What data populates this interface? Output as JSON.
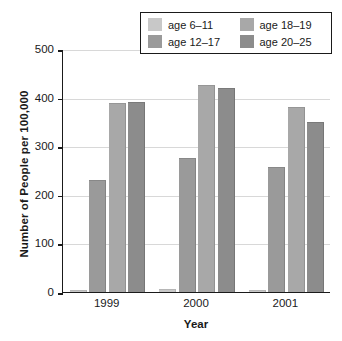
{
  "chart_data": {
    "type": "bar",
    "title": "",
    "xlabel": "Year",
    "ylabel": "Number of People per 100,000",
    "categories": [
      "1999",
      "2000",
      "2001"
    ],
    "ylim": [
      0,
      500
    ],
    "yticks": [
      0,
      100,
      200,
      300,
      400,
      500
    ],
    "ytick_labels": [
      "0",
      "100",
      "200",
      "300",
      "400",
      "500"
    ],
    "grid": true,
    "legend_position": "top-right",
    "series": [
      {
        "name": "age 6–11",
        "color": "#c8c8c8",
        "values": [
          5,
          6,
          5
        ]
      },
      {
        "name": "age 12–17",
        "color": "#9a9a9a",
        "values": [
          230,
          275,
          258
        ]
      },
      {
        "name": "age 18–19",
        "color": "#a8a8a8",
        "values": [
          388,
          427,
          380
        ]
      },
      {
        "name": "age 20–25",
        "color": "#8c8c8c",
        "values": [
          391,
          420,
          350
        ]
      }
    ]
  },
  "legend": {
    "entries": [
      {
        "label": "age 6–11",
        "color": "#c8c8c8"
      },
      {
        "label": "age 18–19",
        "color": "#a8a8a8"
      },
      {
        "label": "age 12–17",
        "color": "#9a9a9a"
      },
      {
        "label": "age 20–25",
        "color": "#8c8c8c"
      }
    ]
  },
  "axes": {
    "y_title": "Number of People per 100,000",
    "x_title": "Year"
  }
}
